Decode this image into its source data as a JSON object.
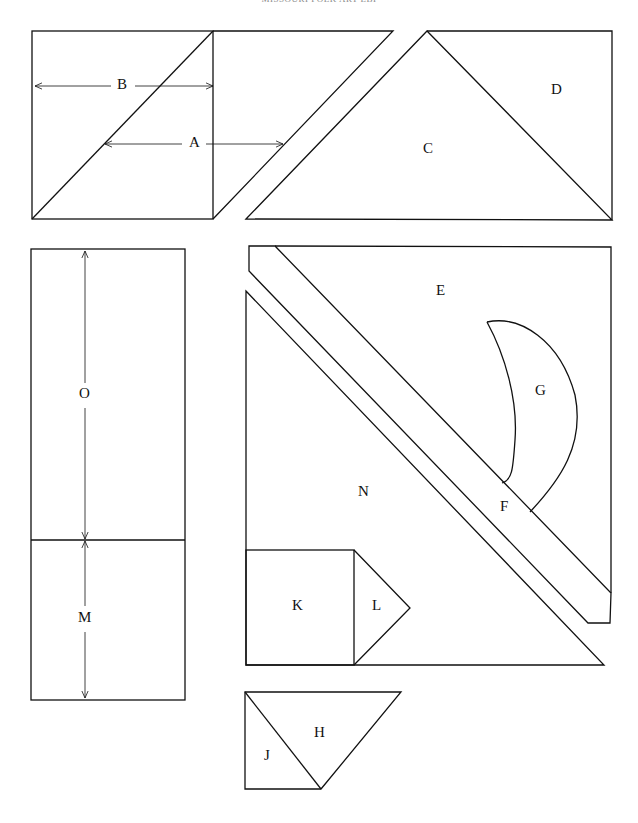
{
  "header": {
    "text": "MISSOURI FOLK ART LBI"
  },
  "pieces": {
    "A": "A",
    "B": "B",
    "C": "C",
    "D": "D",
    "E": "E",
    "F": "F",
    "G": "G",
    "H": "H",
    "J": "J",
    "K": "K",
    "L": "L",
    "M": "M",
    "N": "N",
    "O": "O"
  },
  "colors": {
    "line": "#111111",
    "background": "#ffffff"
  }
}
